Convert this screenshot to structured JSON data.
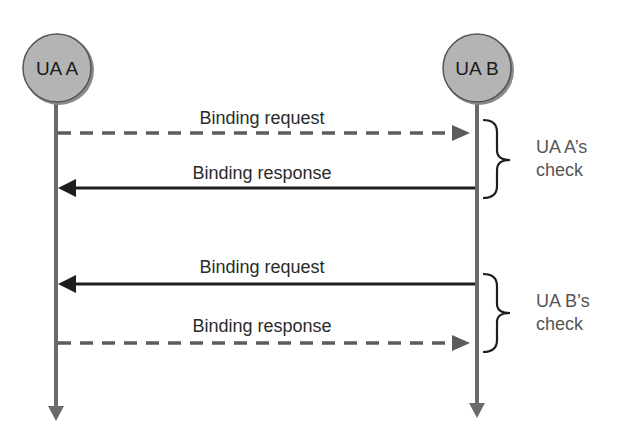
{
  "diagram": {
    "type": "sequence",
    "participants": [
      {
        "id": "A",
        "label": "UA A"
      },
      {
        "id": "B",
        "label": "UA B"
      }
    ],
    "messages": [
      {
        "label": "Binding request",
        "from": "A",
        "to": "B",
        "style": "dashed"
      },
      {
        "label": "Binding response",
        "from": "B",
        "to": "A",
        "style": "solid"
      },
      {
        "label": "Binding request",
        "from": "B",
        "to": "A",
        "style": "solid"
      },
      {
        "label": "Binding response",
        "from": "A",
        "to": "B",
        "style": "dashed"
      }
    ],
    "groups": [
      {
        "line1": "UA A’s",
        "line2": "check"
      },
      {
        "line1": "UA B’s",
        "line2": "check"
      }
    ],
    "colors": {
      "node_fill": "#b4b4b4",
      "lifeline": "#6a6a6a",
      "solid_arrow": "#1e1e1e",
      "dashed_arrow": "#5c5c5c"
    }
  }
}
